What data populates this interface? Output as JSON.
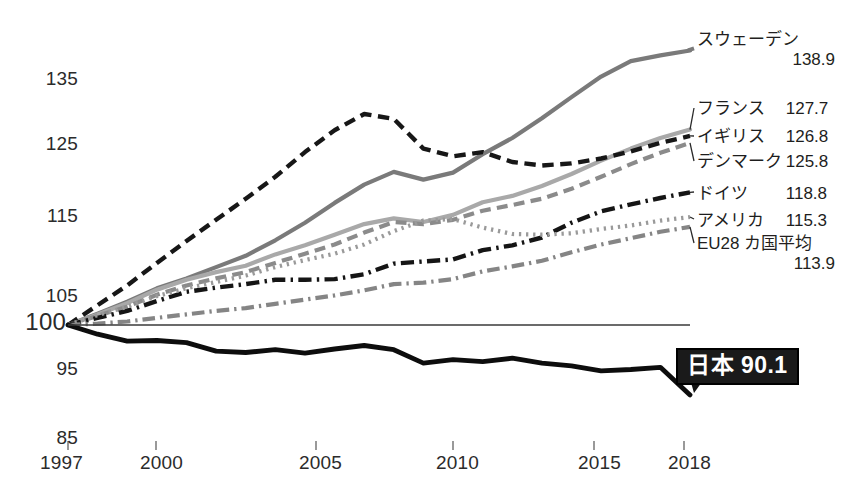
{
  "chart_data": {
    "type": "line",
    "title": "",
    "subtitle": "",
    "xlabel": "",
    "ylabel": "",
    "xlim": [
      1997,
      2018
    ],
    "ylim": [
      85,
      140
    ],
    "grid": false,
    "legend_position": "right-inline-labels",
    "baseline": 100,
    "y_ticks": [
      "135",
      "125",
      "115",
      "105",
      "100",
      "95",
      "85"
    ],
    "y_tick_values": [
      135,
      125,
      115,
      105,
      100,
      95,
      85
    ],
    "x_ticks": [
      "1997",
      "2000",
      "2005",
      "2010",
      "2015",
      "2018"
    ],
    "x_tick_values": [
      1997,
      2000,
      2005,
      2010,
      2015,
      2018
    ],
    "x": [
      1997,
      1998,
      1999,
      2000,
      2001,
      2002,
      2003,
      2004,
      2005,
      2006,
      2007,
      2008,
      2009,
      2010,
      2011,
      2012,
      2013,
      2014,
      2015,
      2016,
      2017,
      2018
    ],
    "series": [
      {
        "name": "スウェーデン",
        "end_value": "138.9",
        "end_value_num": 138.9,
        "style": "solid",
        "color": "#7a7a7a",
        "width": 4.2,
        "values": [
          100,
          101.6,
          103.3,
          105.2,
          106.6,
          108.2,
          109.8,
          112.0,
          114.5,
          117.3,
          119.9,
          121.7,
          120.6,
          121.6,
          124.2,
          126.5,
          129.3,
          132.3,
          135.2,
          137.4,
          138.2,
          138.9
        ]
      },
      {
        "name": "フランス",
        "end_value": "127.7",
        "end_value_num": 127.7,
        "style": "solid",
        "color": "#a9a9a9",
        "width": 4.2,
        "values": [
          100,
          101.5,
          103.1,
          105.0,
          106.4,
          107.5,
          108.4,
          110.0,
          111.3,
          112.8,
          114.3,
          115.1,
          114.6,
          115.6,
          117.4,
          118.3,
          119.7,
          121.4,
          123.3,
          125.0,
          126.5,
          127.7
        ]
      },
      {
        "name": "イギリス",
        "end_value": "126.8",
        "end_value_num": 126.8,
        "style": "dashed",
        "color": "#171717",
        "width": 4.4,
        "values": [
          100,
          102.8,
          105.6,
          108.8,
          111.9,
          114.9,
          117.9,
          121.0,
          124.5,
          127.6,
          129.9,
          129.2,
          125.0,
          123.9,
          124.5,
          123.1,
          122.6,
          122.9,
          123.6,
          124.6,
          125.8,
          126.8
        ]
      },
      {
        "name": "デンマーク",
        "end_value": "125.8",
        "end_value_num": 125.8,
        "style": "dashed",
        "color": "#8b8b8b",
        "width": 4.2,
        "values": [
          100,
          101.3,
          102.6,
          104.3,
          105.6,
          106.6,
          107.5,
          108.8,
          110.1,
          111.4,
          113.1,
          114.6,
          114.3,
          114.9,
          116.2,
          117.0,
          117.9,
          119.3,
          121.0,
          122.8,
          124.4,
          125.8
        ]
      },
      {
        "name": "ドイツ",
        "end_value": "118.8",
        "end_value_num": 118.8,
        "style": "dashdot",
        "color": "#151515",
        "width": 4.4,
        "values": [
          100,
          101.0,
          102.0,
          103.4,
          104.7,
          105.3,
          105.8,
          106.4,
          106.4,
          106.5,
          107.2,
          108.7,
          109.0,
          109.3,
          110.6,
          111.3,
          112.4,
          114.5,
          116.1,
          117.1,
          118.0,
          118.8
        ]
      },
      {
        "name": "アメリカ",
        "end_value": "115.3",
        "end_value_num": 115.3,
        "style": "dotted",
        "color": "#9a9a9a",
        "width": 4.2,
        "values": [
          100,
          101.4,
          102.6,
          104.1,
          105.2,
          106.1,
          107.0,
          108.2,
          109.2,
          110.1,
          111.4,
          113.3,
          114.8,
          115.0,
          113.8,
          112.9,
          112.8,
          113.0,
          113.6,
          114.1,
          114.8,
          115.3
        ]
      },
      {
        "name": "EU28 カ国平均",
        "end_value": "113.9",
        "end_value_num": 113.9,
        "style": "dashdot",
        "color": "#858585",
        "width": 4.2,
        "values": [
          100,
          100.2,
          100.5,
          101.0,
          101.5,
          102.0,
          102.4,
          103.0,
          103.6,
          104.2,
          104.9,
          105.8,
          106.0,
          106.5,
          107.6,
          108.3,
          109.1,
          110.3,
          111.4,
          112.3,
          113.2,
          113.9
        ]
      },
      {
        "name": "日本",
        "end_value": "90.1",
        "end_value_num": 90.1,
        "style": "solid",
        "color": "#0d0d0d",
        "width": 4.8,
        "highlight": true,
        "values": [
          100,
          98.7,
          97.7,
          97.8,
          97.5,
          96.3,
          96.1,
          96.5,
          96.0,
          96.6,
          97.1,
          96.5,
          94.6,
          95.1,
          94.8,
          95.3,
          94.6,
          94.2,
          93.5,
          93.7,
          94.0,
          90.1
        ]
      }
    ]
  },
  "axis": {
    "y_labels": [
      {
        "text": "135"
      },
      {
        "text": "125"
      },
      {
        "text": "115"
      },
      {
        "text": "105"
      },
      {
        "text": "100"
      },
      {
        "text": "95"
      },
      {
        "text": "85"
      }
    ],
    "x_labels": [
      {
        "text": "1997"
      },
      {
        "text": "2000"
      },
      {
        "text": "2005"
      },
      {
        "text": "2010"
      },
      {
        "text": "2015"
      },
      {
        "text": "2018"
      }
    ]
  },
  "labels": {
    "sweden_name": "スウェーデン",
    "sweden_value": "138.9",
    "france_name": "フランス",
    "france_value": "127.7",
    "uk_name": "イギリス",
    "uk_value": "126.8",
    "denmark_name": "デンマーク",
    "denmark_value": "125.8",
    "germany_name": "ドイツ",
    "germany_value": "118.8",
    "usa_name": "アメリカ",
    "usa_value": "115.3",
    "eu28_name": "EU28 カ国平均",
    "eu28_value": "113.9",
    "japan_badge": "日本 90.1"
  }
}
